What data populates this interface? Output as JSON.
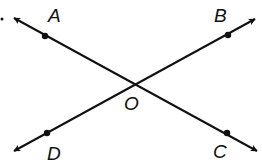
{
  "diagram": {
    "colors": {
      "line": "#111111",
      "background": "#ffffff"
    },
    "points": {
      "A": {
        "label": "A",
        "x": 45,
        "y": 36,
        "label_x": 48,
        "label_y": 22
      },
      "B": {
        "label": "B",
        "x": 228,
        "y": 35,
        "label_x": 214,
        "label_y": 22
      },
      "C": {
        "label": "C",
        "x": 227,
        "y": 133,
        "label_x": 213,
        "label_y": 158
      },
      "D": {
        "label": "D",
        "x": 47,
        "y": 133,
        "label_x": 47,
        "label_y": 160
      },
      "O": {
        "label": "O",
        "x": 135,
        "y": 85,
        "label_x": 124,
        "label_y": 110
      }
    },
    "lines": [
      {
        "name": "line-AC",
        "from": "A",
        "to": "C",
        "start": [
          14,
          18
        ],
        "end": [
          257,
          151
        ]
      },
      {
        "name": "line-DB",
        "from": "D",
        "to": "B",
        "start": [
          14,
          151
        ],
        "end": [
          255,
          19
        ]
      }
    ],
    "stray_dot": {
      "x": 2,
      "y": 19
    }
  }
}
